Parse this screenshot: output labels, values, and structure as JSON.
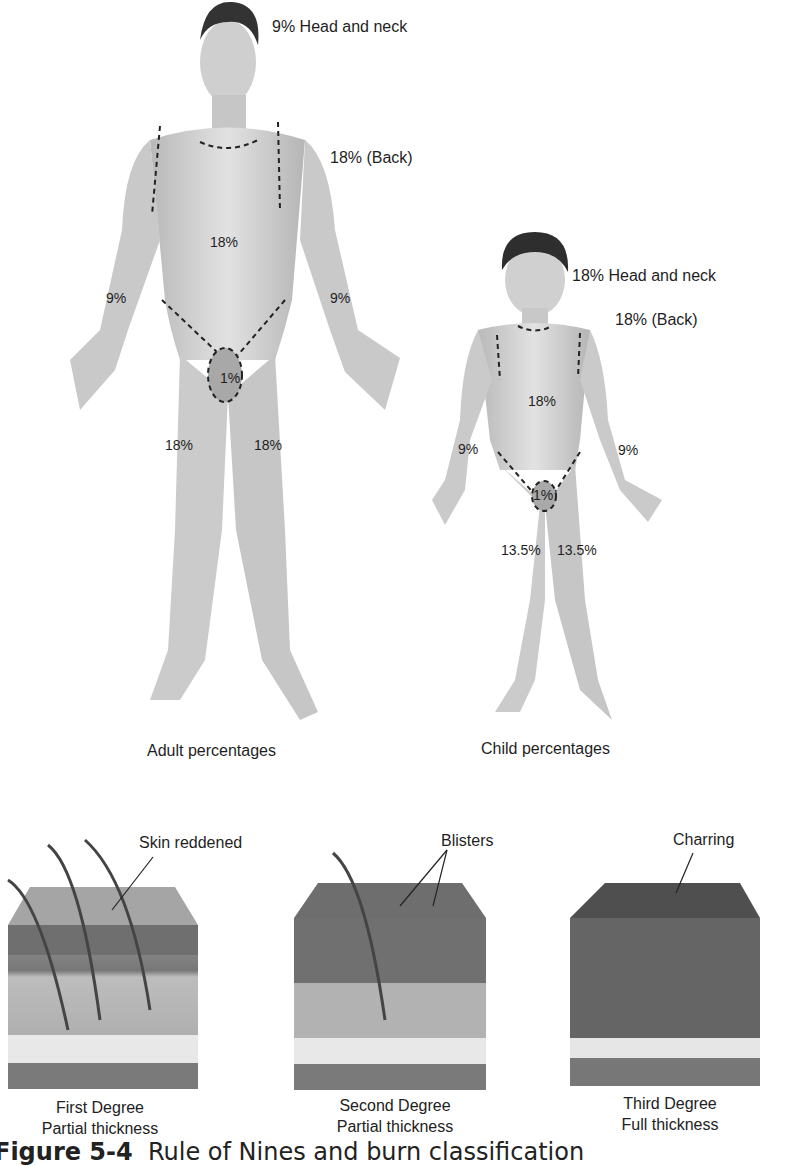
{
  "adult": {
    "title": "Adult percentages",
    "labels": {
      "head_neck": "9% Head and neck",
      "back": "18% (Back)",
      "trunk_front": "18%",
      "left_arm": "9%",
      "right_arm": "9%",
      "genitals": "1%",
      "left_leg": "18%",
      "right_leg": "18%"
    }
  },
  "child": {
    "title": "Child percentages",
    "labels": {
      "head_neck": "18% Head and neck",
      "back": "18% (Back)",
      "trunk_front": "18%",
      "left_arm": "9%",
      "right_arm": "9%",
      "genitals": "1%",
      "left_leg": "13.5%",
      "right_leg": "13.5%"
    }
  },
  "burns": [
    {
      "callout": "Skin reddened",
      "degree": "First Degree",
      "thickness": "Partial thickness"
    },
    {
      "callout": "Blisters",
      "degree": "Second Degree",
      "thickness": "Partial thickness"
    },
    {
      "callout": "Charring",
      "degree": "Third Degree",
      "thickness": "Full thickness"
    }
  ],
  "caption": {
    "prefix": "Figure 5-4",
    "text": "Rule of Nines and burn classification"
  }
}
